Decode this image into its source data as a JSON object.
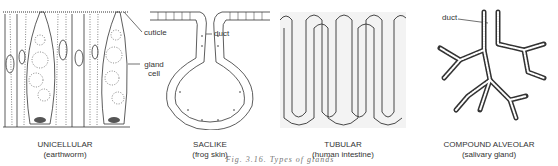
{
  "figure": {
    "panels": [
      {
        "id": "unicellular",
        "title": "UNICELLULAR",
        "subtitle": "(earthworm)",
        "labels": [
          "cuticle",
          "gland cell"
        ]
      },
      {
        "id": "saclike",
        "title": "SACLIKE",
        "subtitle": "(frog skin)",
        "labels": [
          "duct"
        ]
      },
      {
        "id": "tubular",
        "title": "TUBULAR",
        "subtitle": "(human intestine)",
        "labels": []
      },
      {
        "id": "compound-alveolar",
        "title": "COMPOUND ALVEOLAR",
        "subtitle": "(salivary gland)",
        "labels": [
          "duct"
        ]
      }
    ],
    "caption_partial": "Fig. 3.16. Types of glands",
    "caption_note": "bottom caption is cropped and only partially legible"
  },
  "colors": {
    "ink": "#222222",
    "background": "#ffffff"
  }
}
